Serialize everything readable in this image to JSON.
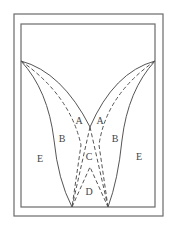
{
  "diagram": {
    "labels": {
      "a_left": "A",
      "a_right": "A",
      "b_left": "B",
      "b_right": "B",
      "c": "C",
      "d": "D",
      "e_left": "E",
      "e_right": "E"
    },
    "colors": {
      "stroke": "#555555",
      "frame": "#6a6a6a",
      "text": "#444444",
      "background": "#ffffff"
    }
  }
}
